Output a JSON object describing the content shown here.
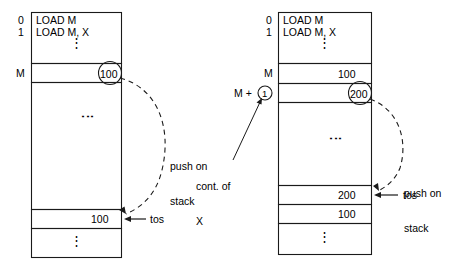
{
  "figure": {
    "type": "memory-stack-diagram",
    "panels": [
      {
        "id": "left",
        "name": "load-m-before",
        "address_labels": [
          {
            "text": "0",
            "row": "instruction-0"
          },
          {
            "text": "1",
            "row": "instruction-1"
          },
          {
            "text": "M",
            "row": "memory-m"
          }
        ],
        "instructions": [
          "LOAD M",
          "LOAD M, X"
        ],
        "vertical_dots": "⋮",
        "memory_rows": [
          {
            "label": "M",
            "value": "100",
            "circled": true
          }
        ],
        "stack_rows": [
          {
            "value": "100",
            "marker": "tos",
            "circled": false
          }
        ],
        "annotations": [
          {
            "name": "push-on-stack",
            "text": "push on\nstack",
            "line1": "push on",
            "line2": "stack"
          },
          {
            "name": "tos-pointer",
            "text": "tos"
          }
        ]
      },
      {
        "id": "right",
        "name": "load-m-x-after",
        "address_labels": [
          {
            "text": "0",
            "row": "instruction-0"
          },
          {
            "text": "1",
            "row": "instruction-1"
          },
          {
            "text": "M",
            "row": "memory-m"
          },
          {
            "text": "M + ①",
            "row": "memory-m-plus-1"
          }
        ],
        "instructions": [
          "LOAD M",
          "LOAD M, X"
        ],
        "vertical_dots": "⋮",
        "memory_rows": [
          {
            "label": "M",
            "value": "100",
            "circled": false
          },
          {
            "label": "M + 1",
            "value": "200",
            "circled": true
          }
        ],
        "stack_rows": [
          {
            "value": "200",
            "marker": "tos",
            "circled": false
          },
          {
            "value": "100",
            "marker": "",
            "circled": false
          }
        ],
        "annotations": [
          {
            "name": "push-on-stack",
            "text": "push on\nstack",
            "line1": "push on",
            "line2": "stack"
          },
          {
            "name": "tos-pointer",
            "text": "tos"
          },
          {
            "name": "cont-of-x",
            "text": "cont. of\nX",
            "line1": "cont. of",
            "line2": "X"
          }
        ],
        "circled_index_label": "1"
      }
    ],
    "colors": {
      "stroke": "#1a1a1a",
      "background": "#ffffff",
      "text": "#000000"
    }
  },
  "left": {
    "addr_0": "0",
    "addr_1": "1",
    "addr_m": "M",
    "instr_0": "LOAD M",
    "instr_1": "LOAD M, X",
    "dots_instr": "⋮",
    "dots_mid": "⋮",
    "dots_bottom": "⋮",
    "m_value": "100",
    "tos_value": "100",
    "tos_label": "tos",
    "push_line1": "push on",
    "push_line2": "stack"
  },
  "right": {
    "addr_0": "0",
    "addr_1": "1",
    "addr_m": "M",
    "addr_m_plus": "M +",
    "addr_m_plus_circle": "1",
    "instr_0": "LOAD M",
    "instr_1": "LOAD M, X",
    "dots_instr": "⋮",
    "dots_mid": "⋮",
    "dots_bottom": "⋮",
    "m_value": "100",
    "m_plus_value": "200",
    "stack_top_value": "200",
    "stack_second_value": "100",
    "tos_label": "tos",
    "push_line1": "push on",
    "push_line2": "stack",
    "cont_line1": "cont. of",
    "cont_line2": "X"
  }
}
